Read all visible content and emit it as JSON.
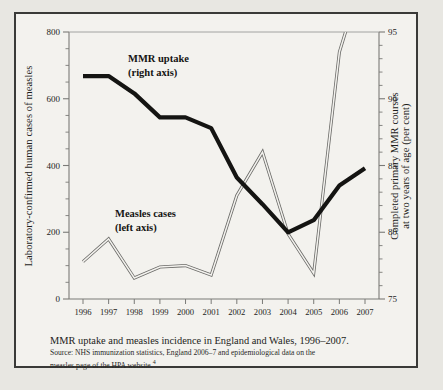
{
  "caption": {
    "title": "MMR uptake and measles incidence in England and Wales, 1996–2007.",
    "source_line1": "Source: NHS immunization statistics, England 2006–7 and epidemiological data on the",
    "source_line2": "measles page of the HPA website.",
    "source_footnote": "4"
  },
  "chart_data": {
    "type": "line",
    "title": "MMR uptake and measles incidence in England and Wales, 1996–2007.",
    "xlabel": "",
    "x": [
      1996,
      1997,
      1998,
      1999,
      2000,
      2001,
      2002,
      2003,
      2004,
      2005,
      2006,
      2007
    ],
    "xtick_labels": [
      "1996",
      "1997",
      "1998",
      "1999",
      "2000",
      "2001",
      "2002",
      "2003",
      "2004",
      "2005",
      "2006",
      "2007"
    ],
    "grid": false,
    "legend": "inline-annotations",
    "axes": {
      "left": {
        "label": "Laboratory-confirmed human cases of measles",
        "ylim": [
          0,
          800
        ],
        "ticks": [
          0,
          200,
          400,
          600,
          800
        ],
        "tick_labels": [
          "0",
          "200",
          "400",
          "600",
          "800"
        ],
        "minor_tick_step": 50
      },
      "right": {
        "label": "Completed primary MMR courses at two years of age (per cent)",
        "ylim": [
          75,
          95
        ],
        "ticks": [
          75,
          80,
          85,
          90,
          95
        ],
        "tick_labels": [
          "75",
          "80",
          "85",
          "90",
          "95"
        ],
        "minor_tick_step": 1
      }
    },
    "series": [
      {
        "name": "MMR uptake",
        "annotation_line1": "MMR uptake",
        "annotation_line2": "(right axis)",
        "axis": "right",
        "unit": "per cent",
        "style": "thick-black",
        "color": "#141412",
        "values": [
          91.7,
          91.7,
          90.4,
          88.6,
          88.6,
          87.8,
          84.1,
          82.1,
          80.0,
          80.9,
          83.5,
          84.8
        ]
      },
      {
        "name": "Measles cases",
        "annotation_line1": "Measles cases",
        "annotation_line2": "(left axis)",
        "axis": "left",
        "unit": "laboratory-confirmed cases",
        "style": "thin-double-outline",
        "color": "#6b6b68",
        "values": [
          112,
          180,
          63,
          96,
          100,
          72,
          310,
          440,
          195,
          77,
          740,
          990
        ]
      }
    ]
  }
}
